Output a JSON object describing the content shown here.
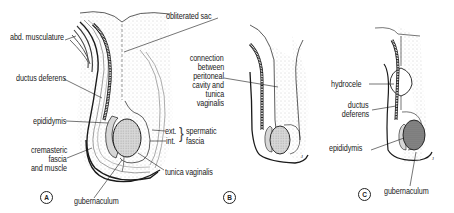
{
  "figure": {
    "panels": [
      {
        "id": "A",
        "letter": "A",
        "labels": {
          "abd_musculature": "abd. musculature",
          "obliterated_sac": "obliterated sac",
          "ductus_deferens": "ductus deferens",
          "epididymis": "epididymis",
          "cremasteric_1": "cremasteric",
          "cremasteric_2": "fascia",
          "cremasteric_3": "and muscle",
          "ext": "ext.",
          "int": "int.",
          "spermatic_1": "spermatic",
          "spermatic_2": "fascia",
          "tunica_vaginalis": "tunica vaginalis",
          "gubernaculum": "gubernaculum"
        }
      },
      {
        "id": "B",
        "letter": "B",
        "labels": {
          "connection_lines": [
            "connection",
            "between",
            "peritoneal",
            "cavity and",
            "tunica",
            "vaginalis"
          ]
        }
      },
      {
        "id": "C",
        "letter": "C",
        "labels": {
          "hydrocele": "hydrocele",
          "ductus_1": "ductus",
          "ductus_2": "deferens",
          "epididymis": "epididymis",
          "gubernaculum": "gubernaculum"
        }
      }
    ],
    "colors": {
      "line": "#1a1a1a",
      "stipple": "#c8c8c8",
      "testis_fill": "#d4d4d4",
      "testis_fill_dark": "#a8a8a8"
    }
  }
}
